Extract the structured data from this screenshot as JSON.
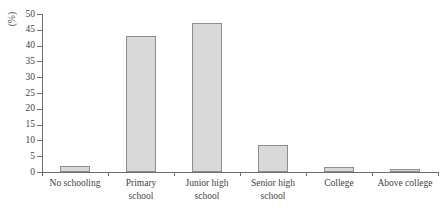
{
  "chart_data": {
    "type": "bar",
    "title": "",
    "xlabel": "",
    "ylabel": "(%)",
    "ylim": [
      0,
      50
    ],
    "ytick_step": 5,
    "grid": false,
    "legend": "none",
    "categories": [
      "No schooling",
      "Primary school",
      "Junior high school",
      "Senior high school",
      "College",
      "Above college"
    ],
    "category_lines": [
      [
        "No schooling"
      ],
      [
        "Primary",
        "school"
      ],
      [
        "Junior high",
        "school"
      ],
      [
        "Senior high",
        "school"
      ],
      [
        "College"
      ],
      [
        "Above college"
      ]
    ],
    "values": [
      2.0,
      43.0,
      47.0,
      8.5,
      1.5,
      1.0
    ],
    "ytick_labels": [
      "0",
      "5",
      "10",
      "15",
      "20",
      "25",
      "30",
      "35",
      "40",
      "45",
      "50"
    ],
    "bar_fill_color": "#d9d9d9",
    "bar_border_color": "#8d8d8d",
    "axis_color": "#6e6e6e",
    "text_color": "#3f3f3f"
  }
}
